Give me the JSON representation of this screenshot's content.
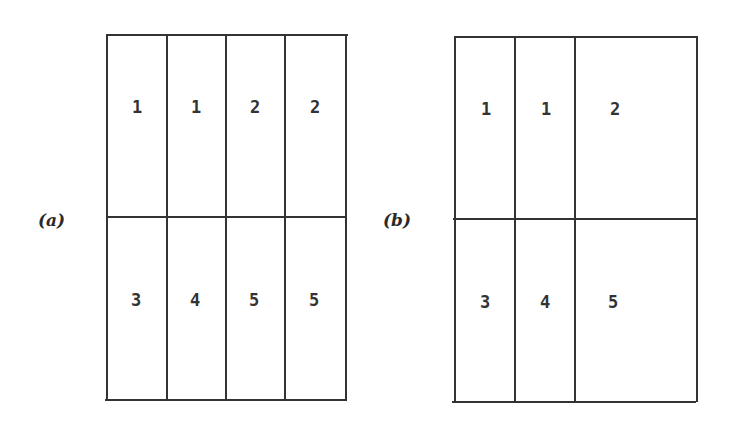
{
  "figure": {
    "panel_a": {
      "label": "(a)",
      "rows": [
        [
          "1",
          "1",
          "2",
          "2"
        ],
        [
          "3",
          "4",
          "5",
          "5"
        ]
      ]
    },
    "panel_b": {
      "label": "(b)",
      "rows": [
        [
          "1",
          "1",
          "2"
        ],
        [
          "3",
          "4",
          "5"
        ]
      ]
    }
  },
  "colors": {
    "line": "#333333",
    "text": "#2a2a2a",
    "background": "#ffffff"
  }
}
